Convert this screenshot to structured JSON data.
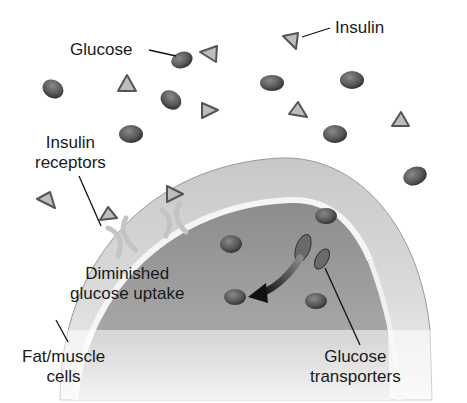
{
  "labels": {
    "glucose": "Glucose",
    "insulin": "Insulin",
    "insulin_receptors_line1": "Insulin",
    "insulin_receptors_line2": "receptors",
    "diminished_line1": "Diminished",
    "diminished_line2": "glucose uptake",
    "fat_muscle_line1": "Fat/muscle",
    "fat_muscle_line2": "cells",
    "glucose_transporters_line1": "Glucose",
    "glucose_transporters_line2": "transporters"
  },
  "colors": {
    "glucose": "#5a5a5a",
    "insulin": "#b8b8b8",
    "cell_outer": "#d6d6d6",
    "cell_inner": "#9a9a9a",
    "membrane": "#f2f2f2",
    "arrow": "#1e1e1e"
  }
}
